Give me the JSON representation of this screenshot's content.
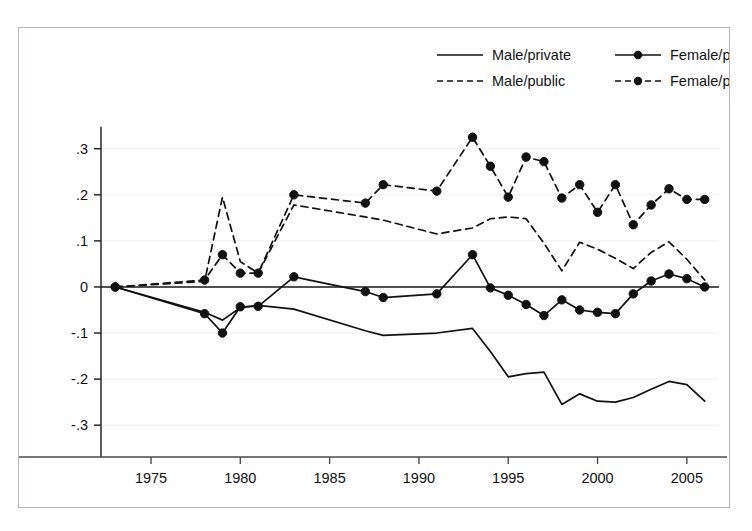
{
  "chart_data": {
    "type": "line",
    "title": "",
    "subtitle": "",
    "xlabel": "",
    "ylabel": "",
    "xlim": [
      1972.2,
      2006.8
    ],
    "ylim": [
      -0.33,
      0.345
    ],
    "xticks": [
      1975,
      1980,
      1985,
      1990,
      1995,
      2000,
      2005
    ],
    "xtick_labels": [
      "1975",
      "1980",
      "1985",
      "1990",
      "1995",
      "2000",
      "2005"
    ],
    "yticks": [
      0.3,
      0.2,
      0.1,
      0,
      -0.1,
      -0.2,
      -0.3
    ],
    "ytick_labels": [
      ".3",
      ".2",
      ".1",
      "0",
      "-.1",
      "-.2",
      "-.3"
    ],
    "grid": false,
    "zero_line": true,
    "legend_position": "top-right",
    "line_color": "#111111",
    "marker_color": "#111111",
    "background_color": "#ffffff",
    "frame_color": "#b9b5ae",
    "x": [
      1973,
      1978,
      1979,
      1980,
      1981,
      1983,
      1987,
      1988,
      1991,
      1993,
      1994,
      1995,
      1996,
      1997,
      1998,
      1999,
      2000,
      2001,
      2002,
      2003,
      2004,
      2005,
      2006
    ],
    "series": [
      {
        "name": "Male/private",
        "style": "solid",
        "markers": false,
        "values": [
          0,
          -0.055,
          -0.072,
          -0.045,
          -0.04,
          -0.048,
          -0.095,
          -0.105,
          -0.1,
          -0.09,
          -0.14,
          -0.195,
          -0.188,
          -0.185,
          -0.255,
          -0.232,
          -0.248,
          -0.25,
          -0.24,
          -0.222,
          -0.205,
          -0.212,
          -0.248
        ]
      },
      {
        "name": "Male/public",
        "style": "dashed",
        "markers": false,
        "values": [
          0,
          0.012,
          0.195,
          0.055,
          0.03,
          0.178,
          0.152,
          0.145,
          0.115,
          0.128,
          0.148,
          0.152,
          0.148,
          0.095,
          0.035,
          0.097,
          0.082,
          0.062,
          0.04,
          0.075,
          0.098,
          0.06,
          0.015
        ]
      },
      {
        "name": "Female/private",
        "style": "solid",
        "markers": true,
        "values": [
          0,
          -0.058,
          -0.1,
          -0.043,
          -0.042,
          0.022,
          -0.01,
          -0.023,
          -0.015,
          0.07,
          -0.002,
          -0.018,
          -0.038,
          -0.062,
          -0.028,
          -0.05,
          -0.055,
          -0.058,
          -0.015,
          0.013,
          0.028,
          0.018,
          0.0
        ]
      },
      {
        "name": "Female/public",
        "style": "dashed",
        "markers": true,
        "values": [
          0,
          0.015,
          0.07,
          0.03,
          0.03,
          0.2,
          0.182,
          0.222,
          0.208,
          0.325,
          0.262,
          0.195,
          0.282,
          0.272,
          0.193,
          0.222,
          0.162,
          0.222,
          0.135,
          0.178,
          0.213,
          0.19,
          0.19
        ]
      }
    ]
  },
  "legend": {
    "entries": [
      {
        "label": "Male/private",
        "style": "solid",
        "marker": false
      },
      {
        "label": "Female/private",
        "style": "solid",
        "marker": true
      },
      {
        "label": "Male/public",
        "style": "dashed",
        "marker": false
      },
      {
        "label": "Female/public",
        "style": "dashed",
        "marker": true
      }
    ]
  }
}
